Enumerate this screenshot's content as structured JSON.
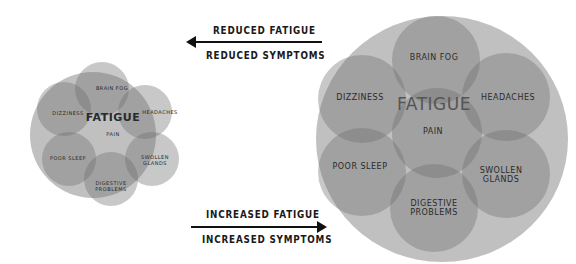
{
  "arrows": {
    "reduce": {
      "top": "REDUCED FATIGUE",
      "bottom": "REDUCED SYMPTOMS",
      "direction": "left"
    },
    "increase": {
      "top": "INCREASED FATIGUE",
      "bottom": "INCREASED SYMPTOMS",
      "direction": "right"
    }
  },
  "small_cluster": {
    "center": "FATIGUE",
    "symptoms": {
      "brain_fog": "BRAIN FOG",
      "dizziness": "DIZZINESS",
      "headaches": "HEADACHES",
      "pain": "PAIN",
      "poor_sleep": "POOR SLEEP",
      "swollen_glands": "SWOLLEN GLANDS",
      "digestive_problems": "DIGESTIVE PROBLEMS"
    }
  },
  "large_cluster": {
    "center": "FATIGUE",
    "symptoms": {
      "brain_fog": "BRAIN FOG",
      "dizziness": "DIZZINESS",
      "headaches": "HEADACHES",
      "pain": "PAIN",
      "poor_sleep": "POOR SLEEP",
      "swollen_glands": "SWOLLEN GLANDS",
      "digestive_problems": "DIGESTIVE PROBLEMS"
    }
  },
  "colors": {
    "circle_fill": "#8c8c8c",
    "text": "#2a2a2a",
    "arrow": "#111111"
  }
}
